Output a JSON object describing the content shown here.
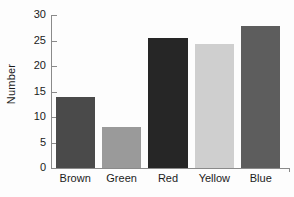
{
  "chart_data": {
    "type": "bar",
    "title": "",
    "subtitle": "",
    "xlabel": "",
    "ylabel": "Number",
    "categories": [
      "Brown",
      "Green",
      "Red",
      "Yellow",
      "Blue"
    ],
    "values": [
      14,
      8.1,
      25.5,
      24.3,
      27.8
    ],
    "bar_colors": [
      "#4a4a4a",
      "#9a9a9a",
      "#262626",
      "#cfcfcf",
      "#5d5d5d"
    ],
    "ylim": [
      0,
      30
    ],
    "yticks": [
      0,
      5,
      10,
      15,
      20,
      25,
      30
    ],
    "ytick_labels": [
      "0",
      "5",
      "10",
      "15",
      "20",
      "25",
      "30"
    ],
    "grid": false,
    "legend": false,
    "legend_position": "none",
    "axis_color": "#8a8a8a",
    "text_color": "#1b1b1b",
    "background_color": "#fdfdfd"
  }
}
